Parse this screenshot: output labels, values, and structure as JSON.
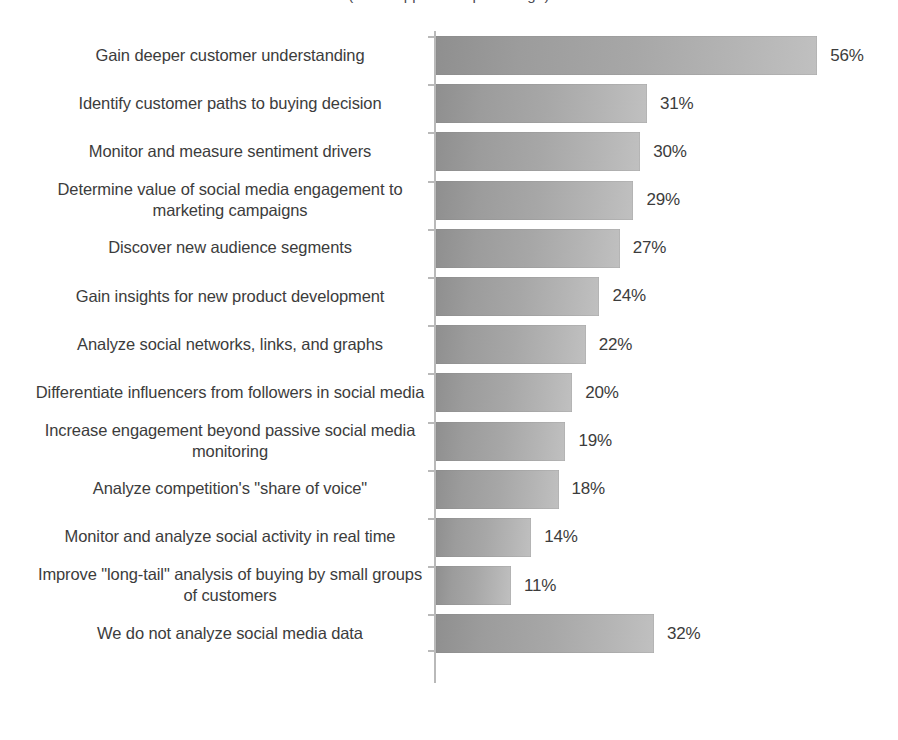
{
  "chart_data": {
    "type": "bar",
    "orientation": "horizontal",
    "title": "(title cropped at top of image)",
    "xlabel": "",
    "ylabel": "",
    "xlim": [
      0,
      60
    ],
    "grid": false,
    "legend": false,
    "value_suffix": "%",
    "categories": [
      "Gain deeper customer understanding",
      "Identify customer paths to buying decision",
      "Monitor and measure sentiment drivers",
      "Determine value of social media engagement to marketing campaigns",
      "Discover new audience segments",
      "Gain insights for new product development",
      "Analyze social networks, links, and graphs",
      "Differentiate influencers from followers in social media",
      "Increase engagement beyond passive social media monitoring",
      "Analyze competition's \"share of voice\"",
      "Monitor and analyze social activity in real time",
      "Improve \"long-tail\" analysis of buying by small groups of customers",
      "We do not analyze social media data"
    ],
    "values": [
      56,
      31,
      30,
      29,
      27,
      24,
      22,
      20,
      19,
      18,
      14,
      11,
      32
    ],
    "value_labels": [
      "56%",
      "31%",
      "30%",
      "29%",
      "27%",
      "24%",
      "22%",
      "20%",
      "19%",
      "18%",
      "14%",
      "11%",
      "32%"
    ],
    "bars": [
      {
        "label": "Gain deeper customer understanding",
        "value": 56,
        "value_label": "56%"
      },
      {
        "label": "Identify customer paths to buying decision",
        "value": 31,
        "value_label": "31%"
      },
      {
        "label": "Monitor and measure sentiment drivers",
        "value": 30,
        "value_label": "30%"
      },
      {
        "label": "Determine value of social media engagement to marketing campaigns",
        "value": 29,
        "value_label": "29%"
      },
      {
        "label": "Discover new audience segments",
        "value": 27,
        "value_label": "27%"
      },
      {
        "label": "Gain insights for new product development",
        "value": 24,
        "value_label": "24%"
      },
      {
        "label": "Analyze social networks, links, and graphs",
        "value": 22,
        "value_label": "22%"
      },
      {
        "label": "Differentiate influencers from followers in social media",
        "value": 20,
        "value_label": "20%"
      },
      {
        "label": "Increase engagement beyond passive social media monitoring",
        "value": 19,
        "value_label": "19%"
      },
      {
        "label": "Analyze competition's \"share of voice\"",
        "value": 18,
        "value_label": "18%"
      },
      {
        "label": "Monitor and analyze social activity in real time",
        "value": 14,
        "value_label": "14%"
      },
      {
        "label": "Improve \"long-tail\" analysis of buying by small groups of customers",
        "value": 11,
        "value_label": "11%"
      },
      {
        "label": "We do not analyze social media data",
        "value": 32,
        "value_label": "32%"
      }
    ],
    "colors": {
      "bar_fill_dark": "#8f8f8f",
      "bar_fill_light": "#c0c0c0",
      "axis": "#b9b9b9",
      "text": "#3c3c3c",
      "background": "#ffffff"
    }
  }
}
